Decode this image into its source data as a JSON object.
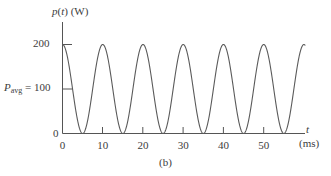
{
  "figure": {
    "caption": "(b)",
    "background": "#ffffff",
    "line_color": "#5a5a5a",
    "axis_color": "#555555",
    "text_color": "#3c3c3c"
  },
  "axes": {
    "y_title_parts": {
      "p": "p",
      "paren_t_open": "(",
      "t": "t",
      "paren_t_close": ")",
      "unit": "(W)"
    },
    "y_title": "p(t) (W)",
    "x_title": "t",
    "x_unit": "(ms)",
    "y_tick_200": "200",
    "y_tick_0": "0",
    "pavg_symbol": "P",
    "pavg_subscript": "avg",
    "pavg_equals": "=",
    "pavg_value": "100"
  },
  "chart_data": {
    "type": "line",
    "title": "",
    "subtitle": "",
    "xlabel": "t (ms)",
    "ylabel": "p(t) (W)",
    "xlim": [
      0,
      60
    ],
    "ylim": [
      0,
      215
    ],
    "grid": false,
    "legend": "none",
    "x_ticks": [
      0,
      10,
      20,
      30,
      40,
      50
    ],
    "x_tick_labels": [
      "0",
      "10",
      "20",
      "30",
      "40",
      "50"
    ],
    "y_ticks": [
      0,
      100,
      200
    ],
    "y_tick_labels": [
      "0",
      "100",
      "200"
    ],
    "annotations": [
      {
        "text": "P_avg = 100",
        "x": 0,
        "y": 100,
        "note": "average power level marked on y-axis"
      },
      {
        "text": "(b)",
        "x": 30,
        "y": -40,
        "note": "figure sub-caption"
      }
    ],
    "series": [
      {
        "name": "p(t)",
        "formula": "p(t) = 100 + 100*cos(2*pi*t/10)",
        "amplitude": 100,
        "offset": 100,
        "period": 10,
        "peak_value": 200,
        "min_value": 0,
        "peaks_at": [
          0,
          10,
          20,
          30,
          40,
          50
        ],
        "zeros_at": [
          5,
          15,
          25,
          35,
          45,
          55
        ],
        "x": [
          0,
          1,
          2,
          3,
          4,
          5,
          6,
          7,
          8,
          9,
          10,
          11,
          12,
          13,
          14,
          15,
          16,
          17,
          18,
          19,
          20,
          21,
          22,
          23,
          24,
          25,
          26,
          27,
          28,
          29,
          30,
          31,
          32,
          33,
          34,
          35,
          36,
          37,
          38,
          39,
          40,
          41,
          42,
          43,
          44,
          45,
          46,
          47,
          48,
          49,
          50,
          51,
          52,
          53,
          54,
          55,
          56,
          57,
          58,
          59
        ],
        "values": [
          200,
          181,
          131,
          69,
          19,
          0,
          19,
          69,
          131,
          181,
          200,
          181,
          131,
          69,
          19,
          0,
          19,
          69,
          131,
          181,
          200,
          181,
          131,
          69,
          19,
          0,
          19,
          69,
          131,
          181,
          200,
          181,
          131,
          69,
          19,
          0,
          19,
          69,
          131,
          181,
          200,
          181,
          131,
          69,
          19,
          0,
          19,
          69,
          131,
          181,
          200,
          181,
          131,
          69,
          19,
          0,
          19,
          69,
          131,
          181
        ]
      }
    ]
  }
}
